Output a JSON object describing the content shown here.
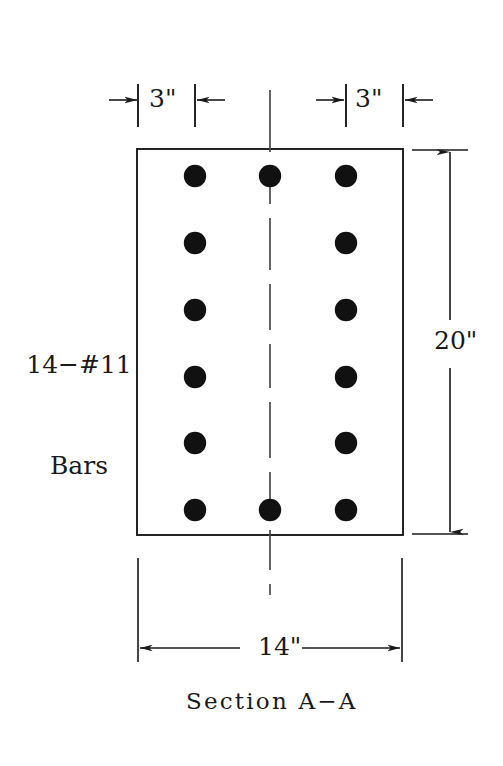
{
  "figure": {
    "caption": "Section A−A",
    "bar_callout_line1": "14−#11",
    "bar_callout_line2": "Bars",
    "bar_callout": "14−#11 Bars",
    "stroke_color": "#1a1a1a",
    "bar_fill_color": "#111111",
    "background_color": "#ffffff"
  },
  "dimensions": {
    "cover_left": "3\"",
    "cover_right": "3\"",
    "height": "20\"",
    "width": "14\""
  },
  "section": {
    "bar_count": 14,
    "bar_designation": "#11",
    "columns": 3,
    "rows": 6,
    "column_x": [
      195,
      270,
      346
    ],
    "row_y": [
      176,
      243,
      310,
      377,
      443,
      510
    ],
    "bar_radius": 11,
    "outline": {
      "x": 137,
      "y": 149,
      "width": 266,
      "height": 386
    },
    "bars": [
      {
        "col": 0,
        "row": 0,
        "cx": 195,
        "cy": 176
      },
      {
        "col": 1,
        "row": 0,
        "cx": 270,
        "cy": 176
      },
      {
        "col": 2,
        "row": 0,
        "cx": 346,
        "cy": 176
      },
      {
        "col": 0,
        "row": 1,
        "cx": 195,
        "cy": 243
      },
      {
        "col": 2,
        "row": 1,
        "cx": 346,
        "cy": 243
      },
      {
        "col": 0,
        "row": 2,
        "cx": 195,
        "cy": 310
      },
      {
        "col": 2,
        "row": 2,
        "cx": 346,
        "cy": 310
      },
      {
        "col": 0,
        "row": 3,
        "cx": 195,
        "cy": 377
      },
      {
        "col": 2,
        "row": 3,
        "cx": 346,
        "cy": 377
      },
      {
        "col": 0,
        "row": 4,
        "cx": 195,
        "cy": 443
      },
      {
        "col": 2,
        "row": 4,
        "cx": 346,
        "cy": 443
      },
      {
        "col": 0,
        "row": 5,
        "cx": 195,
        "cy": 510
      },
      {
        "col": 1,
        "row": 5,
        "cx": 270,
        "cy": 510
      },
      {
        "col": 2,
        "row": 5,
        "cx": 346,
        "cy": 510
      }
    ]
  }
}
